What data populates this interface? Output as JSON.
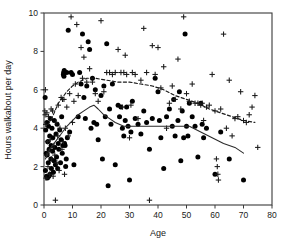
{
  "figure": {
    "background_color": "#ffffff",
    "axis_color": "#3a3a3a",
    "marker_color": "#000000"
  },
  "chart_data": {
    "type": "scatter",
    "title": "",
    "subtitle": "",
    "xlabel": "Age",
    "ylabel": "Hours walkabout per day",
    "xlim": [
      0,
      80
    ],
    "ylim": [
      0,
      10
    ],
    "xticks": [
      0,
      10,
      20,
      30,
      40,
      50,
      60,
      70,
      80
    ],
    "xtick_labels": [
      "0",
      "10",
      "20",
      "30",
      "40",
      "50",
      "60",
      "70",
      "80"
    ],
    "yticks": [
      0,
      2,
      4,
      6,
      8,
      10
    ],
    "ytick_labels": [
      "0",
      "2",
      "4",
      "6",
      "8",
      "10"
    ],
    "grid": false,
    "legend": null,
    "legend_position": "none",
    "annotations": [],
    "series": [
      {
        "name": "filled-circles",
        "marker": "circle",
        "color": "#000000",
        "points": [
          [
            0.4,
            5.6
          ],
          [
            0.5,
            1.8
          ],
          [
            0.6,
            3.9
          ],
          [
            0.8,
            2.7
          ],
          [
            0.9,
            1.5
          ],
          [
            1.0,
            4.3
          ],
          [
            1.1,
            2.6
          ],
          [
            1.2,
            1.4
          ],
          [
            1.3,
            3.3
          ],
          [
            1.5,
            2.2
          ],
          [
            1.6,
            4.1
          ],
          [
            1.7,
            1.5
          ],
          [
            1.8,
            2.9
          ],
          [
            2.0,
            3.6
          ],
          [
            2.1,
            1.6
          ],
          [
            2.2,
            4.5
          ],
          [
            2.4,
            2.4
          ],
          [
            2.5,
            3.1
          ],
          [
            2.6,
            1.9
          ],
          [
            2.8,
            4.0
          ],
          [
            3.0,
            2.8
          ],
          [
            3.1,
            3.5
          ],
          [
            3.3,
            1.7
          ],
          [
            3.5,
            2.3
          ],
          [
            3.6,
            4.4
          ],
          [
            3.8,
            3.0
          ],
          [
            4.0,
            2.1
          ],
          [
            4.2,
            3.7
          ],
          [
            4.4,
            2.5
          ],
          [
            4.6,
            4.2
          ],
          [
            4.8,
            1.9
          ],
          [
            5.0,
            3.2
          ],
          [
            5.2,
            2.9
          ],
          [
            5.5,
            3.9
          ],
          [
            5.8,
            2.2
          ],
          [
            6.0,
            3.4
          ],
          [
            6.2,
            4.6
          ],
          [
            6.4,
            2.7
          ],
          [
            6.6,
            3.1
          ],
          [
            6.8,
            6.8
          ],
          [
            6.9,
            6.9
          ],
          [
            7.0,
            6.7
          ],
          [
            7.1,
            7.0
          ],
          [
            7.2,
            3.2
          ],
          [
            7.4,
            3.1
          ],
          [
            7.6,
            2.0
          ],
          [
            7.8,
            2.4
          ],
          [
            8.0,
            6.9
          ],
          [
            8.2,
            3.5
          ],
          [
            8.5,
            9.1
          ],
          [
            9.0,
            3.8
          ],
          [
            9.5,
            6.9
          ],
          [
            10.0,
            6.8
          ],
          [
            10.5,
            2.1
          ],
          [
            12.0,
            4.6
          ],
          [
            12.5,
            6.9
          ],
          [
            13.0,
            6.3
          ],
          [
            13.5,
            8.9
          ],
          [
            14.0,
            5.6
          ],
          [
            14.5,
            4.5
          ],
          [
            15.0,
            6.2
          ],
          [
            15.5,
            8.5
          ],
          [
            16.0,
            8.1
          ],
          [
            16.5,
            4.0
          ],
          [
            17.0,
            6.6
          ],
          [
            17.5,
            4.3
          ],
          [
            18.0,
            6.0
          ],
          [
            18.5,
            4.2
          ],
          [
            19.0,
            3.4
          ],
          [
            20.0,
            5.7
          ],
          [
            20.5,
            2.4
          ],
          [
            21.0,
            6.2
          ],
          [
            21.5,
            4.6
          ],
          [
            22.0,
            8.4
          ],
          [
            22.5,
            1.0
          ],
          [
            23.0,
            5.0
          ],
          [
            23.5,
            4.2
          ],
          [
            24.0,
            6.3
          ],
          [
            25.0,
            2.1
          ],
          [
            26.0,
            5.2
          ],
          [
            26.5,
            4.6
          ],
          [
            27.0,
            5.1
          ],
          [
            27.5,
            4.0
          ],
          [
            28.0,
            3.6
          ],
          [
            28.5,
            4.4
          ],
          [
            29.0,
            5.1
          ],
          [
            29.5,
            4.1
          ],
          [
            30.0,
            1.3
          ],
          [
            30.5,
            3.8
          ],
          [
            31.0,
            5.4
          ],
          [
            32.0,
            4.5
          ],
          [
            33.0,
            4.2
          ],
          [
            34.0,
            3.7
          ],
          [
            35.0,
            4.9
          ],
          [
            36.0,
            4.3
          ],
          [
            37.0,
            2.9
          ],
          [
            38.0,
            4.5
          ],
          [
            39.0,
            6.6
          ],
          [
            40.0,
            5.9
          ],
          [
            40.5,
            4.4
          ],
          [
            41.0,
            3.5
          ],
          [
            42.0,
            1.9
          ],
          [
            43.0,
            4.6
          ],
          [
            44.0,
            5.0
          ],
          [
            45.0,
            4.1
          ],
          [
            45.5,
            5.5
          ],
          [
            46.0,
            3.6
          ],
          [
            47.0,
            4.4
          ],
          [
            47.5,
            5.9
          ],
          [
            48.0,
            2.3
          ],
          [
            48.5,
            4.9
          ],
          [
            49.0,
            3.5
          ],
          [
            49.5,
            8.9
          ],
          [
            50.0,
            4.1
          ],
          [
            50.5,
            3.6
          ],
          [
            51.0,
            5.3
          ],
          [
            52.0,
            4.6
          ],
          [
            53.0,
            4.1
          ],
          [
            54.0,
            2.5
          ],
          [
            55.0,
            5.3
          ],
          [
            55.5,
            4.2
          ],
          [
            56.0,
            3.5
          ],
          [
            57.0,
            4.0
          ],
          [
            60.0,
            1.6
          ],
          [
            62.0,
            3.8
          ],
          [
            65.0,
            2.4
          ],
          [
            70.0,
            1.3
          ]
        ]
      },
      {
        "name": "plus-symbols",
        "marker": "plus",
        "color": "#1a1a1a",
        "points": [
          [
            0.3,
            4.9
          ],
          [
            0.4,
            4.7
          ],
          [
            0.5,
            6.0
          ],
          [
            0.6,
            4.2
          ],
          [
            0.7,
            1.4
          ],
          [
            0.9,
            2.6
          ],
          [
            1.0,
            4.8
          ],
          [
            1.2,
            3.3
          ],
          [
            1.4,
            2.0
          ],
          [
            1.6,
            4.6
          ],
          [
            1.8,
            2.8
          ],
          [
            2.0,
            1.6
          ],
          [
            2.2,
            3.4
          ],
          [
            2.5,
            5.0
          ],
          [
            2.7,
            2.4
          ],
          [
            3.0,
            4.9
          ],
          [
            3.2,
            1.5
          ],
          [
            3.5,
            3.1
          ],
          [
            3.8,
            2.6
          ],
          [
            4.0,
            0.25
          ],
          [
            4.2,
            4.3
          ],
          [
            4.5,
            2.2
          ],
          [
            4.8,
            3.6
          ],
          [
            5.0,
            5.2
          ],
          [
            5.3,
            1.8
          ],
          [
            5.6,
            4.0
          ],
          [
            6.0,
            5.6
          ],
          [
            6.3,
            2.9
          ],
          [
            6.5,
            5.5
          ],
          [
            6.8,
            3.3
          ],
          [
            7.0,
            5.5
          ],
          [
            7.2,
            1.6
          ],
          [
            7.5,
            4.0
          ],
          [
            8.0,
            5.1
          ],
          [
            8.5,
            3.6
          ],
          [
            9.0,
            5.8
          ],
          [
            9.5,
            9.8
          ],
          [
            10.0,
            4.3
          ],
          [
            10.5,
            5.4
          ],
          [
            11.0,
            6.3
          ],
          [
            11.5,
            9.4
          ],
          [
            12.0,
            5.7
          ],
          [
            13.0,
            8.2
          ],
          [
            13.5,
            6.6
          ],
          [
            14.0,
            7.7
          ],
          [
            15.0,
            6.4
          ],
          [
            16.0,
            7.1
          ],
          [
            17.0,
            6.4
          ],
          [
            18.0,
            5.8
          ],
          [
            19.0,
            5.4
          ],
          [
            20.0,
            9.6
          ],
          [
            21.0,
            5.9
          ],
          [
            22.0,
            6.9
          ],
          [
            23.0,
            6.9
          ],
          [
            24.0,
            6.8
          ],
          [
            25.0,
            6.9
          ],
          [
            26.0,
            8.1
          ],
          [
            27.0,
            6.9
          ],
          [
            27.5,
            5.1
          ],
          [
            28.0,
            6.9
          ],
          [
            28.5,
            7.8
          ],
          [
            29.0,
            6.8
          ],
          [
            30.0,
            3.5
          ],
          [
            30.5,
            5.2
          ],
          [
            31.0,
            6.9
          ],
          [
            32.0,
            6.8
          ],
          [
            33.0,
            4.5
          ],
          [
            34.0,
            6.5
          ],
          [
            35.0,
            9.2
          ],
          [
            36.0,
            6.9
          ],
          [
            37.0,
            0.25
          ],
          [
            38.0,
            8.3
          ],
          [
            39.0,
            6.8
          ],
          [
            40.0,
            8.2
          ],
          [
            41.0,
            6.1
          ],
          [
            42.0,
            7.2
          ],
          [
            43.0,
            4.0
          ],
          [
            44.0,
            5.3
          ],
          [
            45.0,
            6.2
          ],
          [
            46.0,
            5.5
          ],
          [
            47.0,
            7.6
          ],
          [
            48.0,
            5.0
          ],
          [
            49.0,
            9.8
          ],
          [
            50.0,
            5.8
          ],
          [
            51.0,
            5.4
          ],
          [
            52.0,
            6.3
          ],
          [
            53.0,
            5.3
          ],
          [
            54.0,
            5.3
          ],
          [
            55.0,
            5.2
          ],
          [
            55.5,
            5.3
          ],
          [
            56.0,
            4.4
          ],
          [
            57.0,
            5.1
          ],
          [
            58.0,
            5.2
          ],
          [
            59.0,
            6.8
          ],
          [
            60.0,
            4.9
          ],
          [
            60.5,
            2.4
          ],
          [
            60.8,
            2.0
          ],
          [
            61.0,
            1.6
          ],
          [
            61.2,
            1.3
          ],
          [
            62.0,
            5.0
          ],
          [
            63.0,
            8.9
          ],
          [
            64.0,
            4.0
          ],
          [
            65.0,
            6.5
          ],
          [
            66.0,
            3.6
          ],
          [
            67.0,
            4.5
          ],
          [
            68.0,
            4.6
          ],
          [
            69.0,
            5.9
          ],
          [
            70.0,
            4.4
          ],
          [
            71.0,
            4.3
          ],
          [
            72.0,
            4.7
          ],
          [
            73.0,
            5.1
          ],
          [
            74.0,
            5.7
          ],
          [
            75.0,
            3.0
          ]
        ]
      }
    ],
    "curves": [
      {
        "name": "upper-smoother-dashed",
        "style": "dashed",
        "color": "#1a1a1a",
        "points": [
          [
            1.5,
            4.2
          ],
          [
            3.0,
            4.6
          ],
          [
            5.0,
            5.3
          ],
          [
            6.5,
            5.6
          ],
          [
            8.0,
            5.9
          ],
          [
            10.0,
            6.2
          ],
          [
            12.0,
            6.4
          ],
          [
            15.0,
            6.6
          ],
          [
            18.0,
            6.6
          ],
          [
            22.0,
            6.5
          ],
          [
            26.0,
            6.4
          ],
          [
            30.0,
            6.4
          ],
          [
            34.0,
            6.3
          ],
          [
            38.0,
            6.2
          ],
          [
            42.0,
            6.0
          ],
          [
            46.0,
            5.7
          ],
          [
            50.0,
            5.5
          ],
          [
            54.0,
            5.3
          ],
          [
            58.0,
            5.0
          ],
          [
            62.0,
            4.8
          ],
          [
            66.0,
            4.6
          ],
          [
            70.0,
            4.4
          ],
          [
            74.0,
            4.3
          ]
        ]
      },
      {
        "name": "lower-smoother-solid",
        "style": "solid",
        "color": "#2a2a2a",
        "points": [
          [
            0.5,
            2.4
          ],
          [
            2.0,
            2.9
          ],
          [
            4.0,
            3.3
          ],
          [
            6.0,
            3.7
          ],
          [
            8.0,
            4.1
          ],
          [
            10.0,
            4.4
          ],
          [
            12.0,
            4.7
          ],
          [
            14.0,
            4.9
          ],
          [
            16.0,
            5.1
          ],
          [
            17.5,
            5.2
          ],
          [
            19.0,
            5.0
          ],
          [
            21.0,
            4.7
          ],
          [
            23.0,
            4.5
          ],
          [
            25.0,
            4.3
          ],
          [
            28.0,
            4.1
          ],
          [
            32.0,
            4.1
          ],
          [
            36.0,
            4.1
          ],
          [
            40.0,
            4.1
          ],
          [
            44.0,
            4.1
          ],
          [
            48.0,
            4.1
          ],
          [
            51.0,
            4.1
          ],
          [
            55.0,
            3.8
          ],
          [
            59.0,
            3.5
          ],
          [
            63.0,
            3.2
          ],
          [
            67.0,
            3.0
          ],
          [
            70.0,
            2.7
          ]
        ]
      }
    ]
  }
}
